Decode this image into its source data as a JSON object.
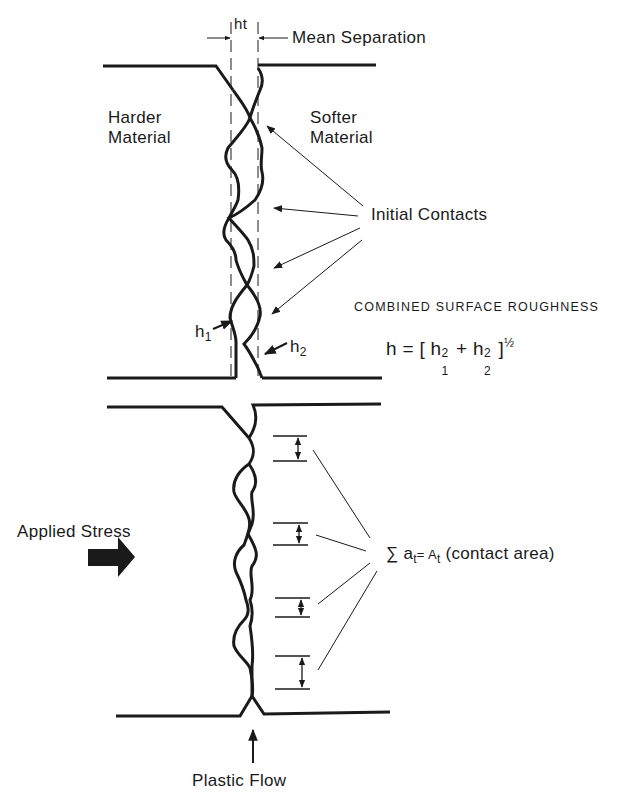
{
  "figure": {
    "top_panel": {
      "gap_label": "ht",
      "mean_separation_label": "Mean Separation",
      "left_material": [
        "Harder",
        "Material"
      ],
      "right_material": [
        "Softer",
        "Material"
      ],
      "contacts_label": "Initial Contacts",
      "h1_label": "h",
      "h1_sub": "1",
      "h2_label": "h",
      "h2_sub": "2",
      "roughness_title": "COMBINED SURFACE ROUGHNESS",
      "formula": {
        "lhs": "h = [ h",
        "h1_sup": "2",
        "h1_sub": "1",
        "plus": " + h",
        "h2_sup": "2",
        "h2_sub": "2",
        "close": " ]",
        "exponent": "½"
      }
    },
    "bottom_panel": {
      "stress_label": "Applied Stress",
      "sum_label_prefix": "∑ a",
      "sum_sub_a": "t",
      "sum_eq": "= A",
      "sum_sub_A": "t",
      "sum_suffix": " (contact area)",
      "flow_label": "Plastic Flow"
    },
    "colors": {
      "ink": "#1a1a1a",
      "background": "#ffffff"
    }
  }
}
